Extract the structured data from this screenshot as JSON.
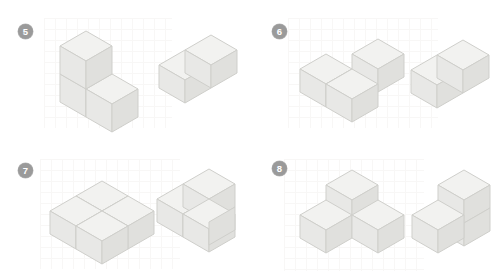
{
  "page": {
    "kind": "isometric-cube-matching-worksheet",
    "background_color": "#ffffff",
    "grid_background_color": "#f6f4f2",
    "badge_color": "#9a9a9a",
    "badge_text_color": "#ffffff",
    "cube_top_color": "#f2f2f0",
    "cube_left_color": "#e8e8e6",
    "cube_right_color": "#e0e0dd",
    "cube_stroke_color": "#cfcfcb"
  },
  "items": [
    {
      "number": "5",
      "badge_name": "item-badge-5",
      "left_figure": {
        "name": "figure-5-left",
        "description": "L-shaped tricube: one cube stacked on a base cube with a third cube attached to its right",
        "cube_count": 3,
        "cubes": [
          [
            0,
            0,
            0
          ],
          [
            0,
            0,
            1
          ],
          [
            1,
            0,
            0
          ]
        ]
      },
      "right_figure": {
        "name": "figure-5-right",
        "description": "Two cubes joined side by side in a row",
        "cube_count": 2,
        "cubes": [
          [
            0,
            0,
            0
          ],
          [
            1,
            0,
            0
          ]
        ]
      }
    },
    {
      "number": "6",
      "badge_name": "item-badge-6",
      "left_figure": {
        "name": "figure-6-left",
        "description": "Flat L-tromino lying on the ground plane",
        "cube_count": 3,
        "cubes": [
          [
            0,
            0,
            0
          ],
          [
            1,
            0,
            0
          ],
          [
            1,
            1,
            0
          ]
        ]
      },
      "right_figure": {
        "name": "figure-6-right",
        "description": "Two cubes joined side by side in a row",
        "cube_count": 2,
        "cubes": [
          [
            0,
            0,
            0
          ],
          [
            1,
            0,
            0
          ]
        ]
      }
    },
    {
      "number": "7",
      "badge_name": "item-badge-7",
      "left_figure": {
        "name": "figure-7-left",
        "description": "Flat 2 by 2 square slab of four cubes",
        "cube_count": 4,
        "cubes": [
          [
            0,
            0,
            0
          ],
          [
            1,
            0,
            0
          ],
          [
            0,
            1,
            0
          ],
          [
            1,
            1,
            0
          ]
        ]
      },
      "right_figure": {
        "name": "figure-7-right",
        "description": "Four cubes: an upright 2 by 2 block seen from the front corner",
        "cube_count": 4,
        "cubes": [
          [
            0,
            0,
            0
          ],
          [
            1,
            0,
            0
          ],
          [
            0,
            0,
            1
          ],
          [
            1,
            0,
            1
          ]
        ]
      }
    },
    {
      "number": "8",
      "badge_name": "item-badge-8",
      "left_figure": {
        "name": "figure-8-left",
        "description": "Tripod of three cubes: one raised rear cube with a cube to its front-left and front-right",
        "cube_count": 3,
        "cubes": [
          [
            1,
            1,
            1
          ],
          [
            0,
            1,
            0
          ],
          [
            1,
            0,
            0
          ]
        ]
      },
      "right_figure": {
        "name": "figure-8-right",
        "description": "Staircase of three cubes: an upright column of two with one cube at the front-left base",
        "cube_count": 3,
        "cubes": [
          [
            1,
            0,
            0
          ],
          [
            1,
            0,
            1
          ],
          [
            0,
            0,
            0
          ]
        ]
      }
    }
  ]
}
